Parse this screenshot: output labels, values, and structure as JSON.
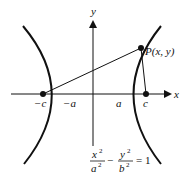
{
  "diagram": {
    "axes": {
      "x_label": "x",
      "y_label": "y"
    },
    "point": {
      "label": "P(x, y)",
      "x": 141,
      "y": 48
    },
    "foci": [
      {
        "label": "−c",
        "x": 43,
        "y": 94
      },
      {
        "label": "c",
        "x": 146,
        "y": 94
      }
    ],
    "vertices": [
      {
        "label": "−a",
        "x": 59
      },
      {
        "label": "a",
        "x": 127
      }
    ],
    "equation": {
      "num1": "x",
      "sup1": "2",
      "den1": "a",
      "dsup1": "2",
      "minus": "−",
      "num2": "y",
      "sup2": "2",
      "den2": "b",
      "dsup2": "2",
      "rhs": "= 1"
    },
    "colors": {
      "stroke": "#111111",
      "background": "#ffffff"
    }
  }
}
